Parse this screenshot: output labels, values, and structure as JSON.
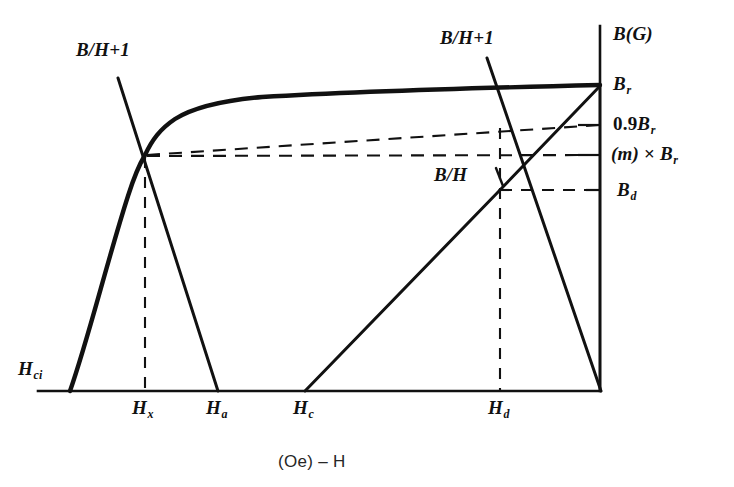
{
  "figure": {
    "title_axis_y": "B(G)",
    "title_axis_x": "(Oe) – H",
    "background": "#ffffff",
    "stroke": "#111111"
  },
  "labels": {
    "b_over_h_plus_1_left": "B/H+1",
    "b_over_h_plus_1_right": "B/H+1",
    "b_over_h": "B/H",
    "b_r": "B",
    "b_r_sub": "r",
    "zero_nine_b_r_num": "0.9",
    "zero_nine_b_r_b": "B",
    "zero_nine_b_r_sub": "r",
    "m_times_b_r_m": "(m)",
    "m_times_b_r_op": "×",
    "m_times_b_r_b": "B",
    "m_times_b_r_sub": "r",
    "b_d": "B",
    "b_d_sub": "d",
    "h_ci": "H",
    "h_ci_sub": "ci",
    "h_x": "H",
    "h_x_sub": "x",
    "h_a": "H",
    "h_a_sub": "a",
    "h_c": "H",
    "h_c_sub": "c",
    "h_d": "H",
    "h_d_sub": "d"
  },
  "chart_data": {
    "type": "line",
    "title": "",
    "xlabel": "(Oe) – H",
    "ylabel": "B(G)",
    "grid": false,
    "legend": "none",
    "axis_geometry": {
      "origin_px": [
        600,
        391
      ],
      "x_axis_left_px": 38,
      "y_axis_top_px": 26,
      "note": "x increases to the LEFT (negative H field), y increases upward"
    },
    "x_ticks": [
      {
        "name": "H_ci",
        "px": 70
      },
      {
        "name": "H_x",
        "px": 145
      },
      {
        "name": "H_a",
        "px": 218
      },
      {
        "name": "H_c",
        "px": 305
      },
      {
        "name": "H_d",
        "px": 500
      },
      {
        "name": "origin",
        "px": 600
      }
    ],
    "y_ticks": [
      {
        "name": "B_r",
        "px": 85
      },
      {
        "name": "0.9B_r",
        "px": 125
      },
      {
        "name": "(m)xB_r",
        "px": 155
      },
      {
        "name": "B_d",
        "px": 190
      },
      {
        "name": "origin",
        "px": 391
      }
    ],
    "series": [
      {
        "name": "intrinsic-demagnetization-curve",
        "style": "solid-heavy",
        "points": [
          [
            70,
            391
          ],
          [
            100,
            300
          ],
          [
            120,
            230
          ],
          [
            135,
            185
          ],
          [
            145,
            155
          ],
          [
            160,
            125
          ],
          [
            185,
            110
          ],
          [
            230,
            100
          ],
          [
            300,
            96
          ],
          [
            400,
            92
          ],
          [
            500,
            88
          ],
          [
            600,
            85
          ]
        ]
      },
      {
        "name": "normal-curve-Br-to-Ha",
        "style": "solid",
        "points": [
          [
            145,
            155
          ],
          [
            218,
            391
          ]
        ]
      },
      {
        "name": "load-line-B-over-H-plus-1-left",
        "style": "solid",
        "points": [
          [
            118,
            78
          ],
          [
            145,
            155
          ],
          [
            218,
            391
          ]
        ]
      },
      {
        "name": "load-line-B-over-H-plus-1-right",
        "style": "solid",
        "points": [
          [
            487,
            58
          ],
          [
            600,
            391
          ]
        ]
      },
      {
        "name": "load-line-B-over-H",
        "style": "solid",
        "points": [
          [
            305,
            391
          ],
          [
            500,
            190
          ],
          [
            600,
            85
          ]
        ]
      },
      {
        "name": "recoil-line-to-origin",
        "style": "solid",
        "points": [
          [
            600,
            85
          ],
          [
            600,
            391
          ]
        ]
      },
      {
        "name": "dashed-0.9Br-line",
        "style": "dashed",
        "points": [
          [
            145,
            155
          ],
          [
            600,
            125
          ]
        ]
      },
      {
        "name": "dashed-m-times-Br-line",
        "style": "dashed",
        "points": [
          [
            145,
            155
          ],
          [
            600,
            155
          ]
        ]
      },
      {
        "name": "dashed-Bd-line",
        "style": "dashed",
        "points": [
          [
            500,
            190
          ],
          [
            600,
            190
          ]
        ]
      },
      {
        "name": "dashed-Hx-vertical",
        "style": "dashed",
        "points": [
          [
            145,
            155
          ],
          [
            145,
            391
          ]
        ]
      },
      {
        "name": "dashed-Hd-vertical",
        "style": "dashed",
        "points": [
          [
            500,
            190
          ],
          [
            500,
            391
          ]
        ]
      }
    ]
  }
}
